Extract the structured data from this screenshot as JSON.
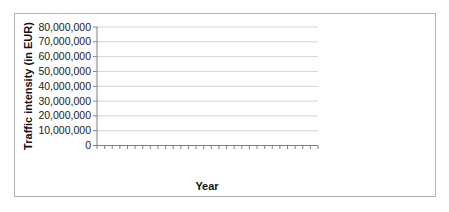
{
  "frame": {
    "border_color": "#b3b3b3",
    "background": "#ffffff"
  },
  "chart_data": {
    "type": "line",
    "title": "",
    "xlabel": "Year",
    "ylabel": "Traffic intensity (in EUR)",
    "unit": "EUR",
    "grid": "horizontal",
    "gridline_color": "#d3d3d3",
    "axis_color": "#808080",
    "tick_label_color": "#1a1a1a",
    "legend_position": "right",
    "ylim": [
      0,
      80000000
    ],
    "y_tick_interval": 10000000,
    "y_ticks": [
      0,
      10000000,
      20000000,
      30000000,
      40000000,
      50000000,
      60000000,
      70000000,
      80000000
    ],
    "x": [
      2017,
      2018,
      2019,
      2020,
      2021,
      2022,
      2023,
      2024,
      2025,
      2026,
      2027,
      2028,
      2029,
      2030,
      2031,
      2032,
      2033,
      2034,
      2035,
      2036,
      2037,
      2038,
      2039,
      2040,
      2041,
      2042,
      2043,
      2044,
      2045
    ],
    "x_tick_labels": [
      "2017",
      "2019",
      "2021",
      "2023",
      "2025",
      "2027",
      "2029",
      "2031",
      "2033",
      "2035",
      "2037",
      "2039",
      "2041",
      "2043",
      "2045"
    ],
    "x_tick_step": 2,
    "series": [
      {
        "name": "Low growth",
        "line_style": "dashed",
        "dash": "4 3",
        "color": "#808080",
        "width": 1.2,
        "values": [
          22000000,
          22200000,
          22300000,
          22500000,
          22700000,
          22800000,
          23000000,
          23200000,
          23400000,
          23500000,
          23700000,
          23900000,
          24100000,
          24200000,
          24400000,
          24600000,
          24800000,
          25000000,
          25200000,
          25400000,
          25500000,
          25700000,
          25900000,
          26100000,
          26300000,
          26500000,
          26700000,
          26900000,
          27100000
        ]
      },
      {
        "name": "Medium growth",
        "line_style": "long-dash",
        "dash": "8 4",
        "color": "#262626",
        "width": 2,
        "values": [
          22000000,
          22600000,
          23100000,
          23700000,
          24300000,
          24900000,
          25500000,
          26200000,
          26800000,
          27500000,
          28200000,
          28900000,
          29600000,
          30300000,
          31100000,
          31900000,
          32700000,
          33500000,
          34300000,
          35200000,
          36100000,
          37000000,
          37900000,
          38800000,
          39800000,
          40800000,
          41800000,
          42900000,
          43900000
        ]
      },
      {
        "name": "High growth",
        "line_style": "dotted",
        "dash": "1.4 2.3",
        "color": "#bfbfbf",
        "width": 1.3,
        "values": [
          22000000,
          22900000,
          23900000,
          24900000,
          25900000,
          27000000,
          28100000,
          29200000,
          30500000,
          31700000,
          33000000,
          34400000,
          35800000,
          37300000,
          38900000,
          40500000,
          42200000,
          43900000,
          45700000,
          47600000,
          49600000,
          51700000,
          53800000,
          56100000,
          58400000,
          60800000,
          63300000,
          66000000,
          68700000
        ]
      },
      {
        "name": "Trend growth",
        "line_style": "dash-dot",
        "dash": "2 2 6 2",
        "color": "#404040",
        "width": 1.3,
        "values": [
          22000000,
          22300000,
          22500000,
          22800000,
          23100000,
          23400000,
          23600000,
          23900000,
          24200000,
          24500000,
          24800000,
          25100000,
          25400000,
          25700000,
          26000000,
          26300000,
          26600000,
          26900000,
          27300000,
          27600000,
          27900000,
          28300000,
          28600000,
          28900000,
          29300000,
          29600000,
          30000000,
          30400000,
          30700000
        ]
      },
      {
        "name": "Zero growth",
        "line_style": "solid",
        "dash": "",
        "color": "#000000",
        "width": 2.3,
        "values": [
          22000000,
          22000000,
          22000000,
          22000000,
          22000000,
          22000000,
          22000000,
          22000000,
          22000000,
          22000000,
          22000000,
          22000000,
          22000000,
          22000000,
          22000000,
          22000000,
          22000000,
          22000000,
          22000000,
          22000000,
          22000000,
          22000000,
          22000000,
          22000000,
          22000000,
          22000000,
          22000000,
          22000000,
          22000000
        ]
      }
    ]
  }
}
